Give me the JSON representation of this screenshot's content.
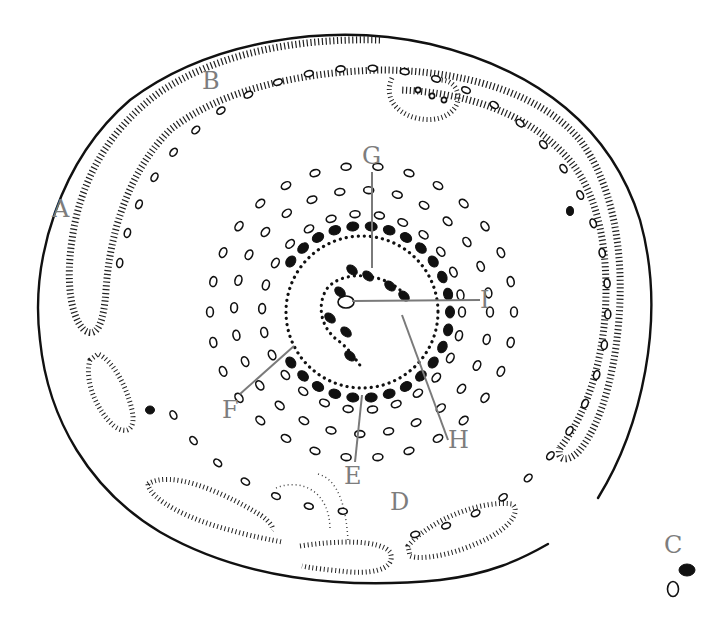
{
  "figure": {
    "type": "archaeological site plan",
    "labels": {
      "A": "A",
      "B": "B",
      "C": "C",
      "D": "D",
      "E": "E",
      "F": "F",
      "G": "G",
      "H": "H",
      "I": "I"
    },
    "colors": {
      "line": "#111111",
      "label": "#7d7d7d",
      "leader": "#7a7a7a",
      "background": "#ffffff"
    }
  }
}
